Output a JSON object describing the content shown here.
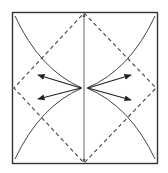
{
  "diagram": {
    "colors": {
      "line": "#333333",
      "background": "#ffffff"
    },
    "square": {
      "x": 12,
      "y": 12,
      "width": 146,
      "height": 152
    },
    "center_line": {
      "x": 84,
      "y1": 12,
      "y2": 164,
      "style": "solid",
      "arrows": "both"
    },
    "valley_fold_diamond": {
      "top": [
        84,
        12
      ],
      "right": [
        156,
        88
      ],
      "bottom": [
        84,
        164
      ],
      "left": [
        14,
        88
      ],
      "style": "dashed"
    },
    "curves": [
      {
        "name": "top-left",
        "from": [
          15,
          16
        ],
        "to": [
          82,
          88
        ]
      },
      {
        "name": "bottom-left",
        "from": [
          82,
          88
        ],
        "to": [
          15,
          159
        ]
      },
      {
        "name": "top-right",
        "from": [
          155,
          16
        ],
        "to": [
          87,
          88
        ]
      },
      {
        "name": "bottom-right",
        "from": [
          87,
          88
        ],
        "to": [
          155,
          159
        ]
      }
    ],
    "arrows": [
      {
        "name": "left-upper",
        "from": [
          81,
          88
        ],
        "to": [
          38,
          75
        ]
      },
      {
        "name": "left-lower",
        "from": [
          81,
          88
        ],
        "to": [
          38,
          99
        ]
      },
      {
        "name": "right-upper",
        "from": [
          88,
          88
        ],
        "to": [
          131,
          75
        ]
      },
      {
        "name": "right-lower",
        "from": [
          88,
          88
        ],
        "to": [
          131,
          100
        ]
      }
    ]
  }
}
